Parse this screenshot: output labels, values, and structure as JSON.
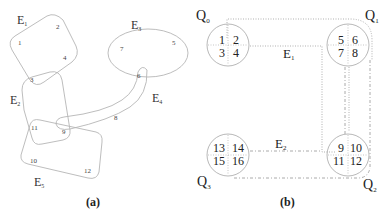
{
  "panel_a": {
    "caption": "(a)",
    "hyperedges": [
      {
        "label": "E",
        "sub": "1"
      },
      {
        "label": "E",
        "sub": "2"
      },
      {
        "label": "E",
        "sub": "3"
      },
      {
        "label": "E",
        "sub": "4"
      },
      {
        "label": "E",
        "sub": "5"
      }
    ],
    "vertices": [
      "1",
      "2",
      "3",
      "4",
      "5",
      "6",
      "7",
      "8",
      "9",
      "10",
      "11",
      "12"
    ]
  },
  "panel_b": {
    "caption": "(b)",
    "parts": [
      {
        "label": "Q",
        "sub": "0",
        "cells": [
          "1",
          "2",
          "3",
          "4"
        ]
      },
      {
        "label": "Q",
        "sub": "1",
        "cells": [
          "5",
          "6",
          "7",
          "8"
        ]
      },
      {
        "label": "Q",
        "sub": "2",
        "cells": [
          "9",
          "10",
          "11",
          "12"
        ]
      },
      {
        "label": "Q",
        "sub": "3",
        "cells": [
          "13",
          "14",
          "15",
          "16"
        ]
      }
    ],
    "edges": [
      {
        "label": "E",
        "sub": "1"
      },
      {
        "label": "E",
        "sub": "2"
      }
    ]
  }
}
